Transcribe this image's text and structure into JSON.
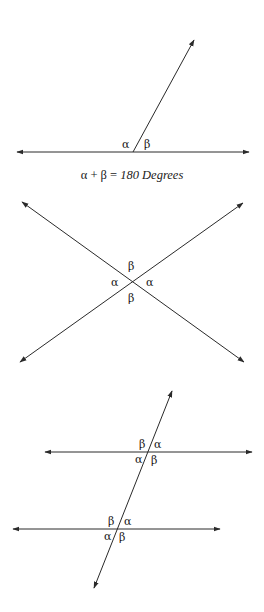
{
  "diagrams": [
    {
      "name": "supplementary-angles",
      "labels": {
        "alpha": "α",
        "beta": "β"
      },
      "caption": {
        "lhs": "α + β = ",
        "rhs": "180 Degrees"
      }
    },
    {
      "name": "vertical-angles",
      "labels": {
        "top": "β",
        "left": "α",
        "right": "α",
        "bottom": "β"
      }
    },
    {
      "name": "parallel-lines-transversal",
      "upper": {
        "tl": "β",
        "tr": "α",
        "bl": "α",
        "br": "β"
      },
      "lower": {
        "tl": "β",
        "tr": "α",
        "bl": "α",
        "br": "β"
      }
    }
  ],
  "colors": {
    "line": "#2a2a2a",
    "text": "#1a1a1a",
    "background": "#ffffff"
  }
}
